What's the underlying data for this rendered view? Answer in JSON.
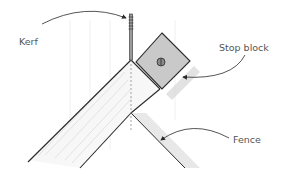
{
  "labels": {
    "kerf": "Kerf",
    "stop_block": "Stop block",
    "fence": "Fence"
  },
  "colors": {
    "line": "#2a2a2a",
    "label": "#555555",
    "block_fill": "#c9c9c9",
    "board_shade": "#e6e6e6",
    "shadow": "#bdbdbd"
  }
}
